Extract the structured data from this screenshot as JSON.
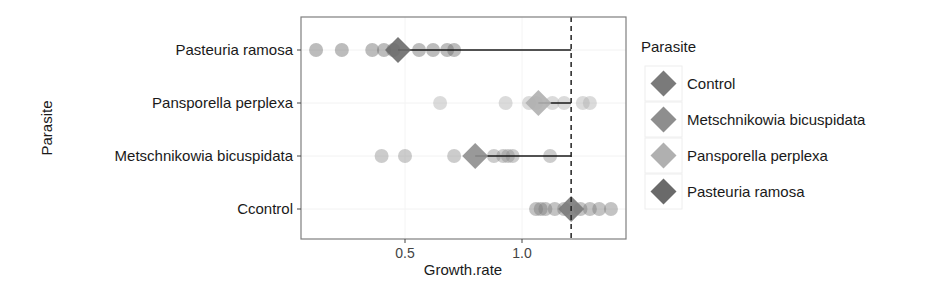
{
  "chart_data": {
    "type": "scatter",
    "subtype": "dot-plot with mean diamonds and segments to control reference",
    "title": "",
    "xlabel": "Growth.rate",
    "ylabel": "Parasite",
    "xlim": [
      0.04,
      1.43
    ],
    "xticks": [
      0.5,
      1.0
    ],
    "xtick_labels": [
      "0.5",
      "1.0"
    ],
    "categories": [
      "Ccontrol",
      "Metschnikowia bicuspidata",
      "Pansporella perplexa",
      "Pasteuria ramosa"
    ],
    "reference_line": {
      "x": 1.21,
      "style": "dashed",
      "label": "Control mean"
    },
    "grid": true,
    "legend": {
      "title": "Parasite",
      "position": "right",
      "entries": [
        "Control",
        "Metschnikowia bicuspidata",
        "Pansporella perplexa",
        "Pasteuria ramosa"
      ]
    },
    "series": [
      {
        "name": "Control",
        "category": "Ccontrol",
        "color": "#7a7a7a",
        "points": [
          1.06,
          1.08,
          1.1,
          1.14,
          1.18,
          1.25,
          1.29,
          1.33,
          1.38
        ],
        "mean": 1.21
      },
      {
        "name": "Metschnikowia bicuspidata",
        "category": "Metschnikowia bicuspidata",
        "color": "#8e8e8e",
        "points": [
          0.4,
          0.5,
          0.71,
          0.88,
          0.92,
          0.94,
          0.96,
          1.12
        ],
        "mean": 0.8
      },
      {
        "name": "Pansporella perplexa",
        "category": "Pansporella perplexa",
        "color": "#b0b0b0",
        "points": [
          0.65,
          0.93,
          1.03,
          1.06,
          1.13,
          1.18,
          1.26,
          1.29
        ],
        "mean": 1.07
      },
      {
        "name": "Pasteuria ramosa",
        "category": "Pasteuria ramosa",
        "color": "#6a6a6a",
        "points": [
          0.12,
          0.23,
          0.36,
          0.41,
          0.45,
          0.56,
          0.62,
          0.68,
          0.71
        ],
        "mean": 0.47
      }
    ]
  },
  "plot": {
    "panel": {
      "x": 301,
      "y": 17,
      "w": 325,
      "h": 222
    },
    "px_per_unit": 234,
    "x_at_0_5": 405,
    "row_y": {
      "Pasteuria ramosa": 50,
      "Pansporella perplexa": 103,
      "Metschnikowia bicuspidata": 156,
      "Ccontrol": 209
    }
  }
}
